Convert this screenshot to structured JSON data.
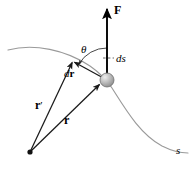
{
  "figure": {
    "background_color": "#ffffff",
    "width": 193,
    "height": 172
  },
  "colors": {
    "path_curve": "#9a9a9a",
    "vector_stroke": "#1a1a1a",
    "force_stroke": "#000000",
    "particle_fill": "#b0b0b0",
    "particle_edge": "#6e6e6e",
    "particle_highlight": "#e8e8e8",
    "dashed_leader": "#555555",
    "angle_arc": "#333333",
    "label_text": "#000000"
  },
  "labels": {
    "force": "F",
    "angle": "θ",
    "arc_length": "ds",
    "arc_length_d": "d",
    "arc_length_s": "s",
    "displacement_d": "d",
    "displacement_r": "r",
    "position_initial": "r",
    "position_initial_prime": "′",
    "position_final": "r",
    "path_parameter": "s"
  },
  "geometry": {
    "particle": {
      "cx": 107,
      "cy": 80,
      "r": 7
    },
    "origin": {
      "x": 30,
      "y": 152
    },
    "force_vector": {
      "x1": 107,
      "y1": 80,
      "x2": 107,
      "y2": 6
    },
    "dr_vector": {
      "x1": 107,
      "y1": 80,
      "x2": 73,
      "y2": 61
    },
    "r_prime_vector": {
      "x1": 30,
      "y1": 152,
      "x2": 73,
      "y2": 61
    },
    "r_vector": {
      "x1": 30,
      "y1": 152,
      "x2": 100,
      "y2": 84
    },
    "angle_arc": {
      "cx": 107,
      "cy": 80,
      "radius": 32,
      "start_deg": 90,
      "end_deg": 151
    },
    "curve": "M 8,50 C 34,43 66,50 90,66 C 100,73 106,79 112,88 C 126,110 140,134 162,146 C 172,151 180,153 188,153"
  },
  "annotations": [
    {
      "name": "force-arrow",
      "text": "F",
      "description": "applied force vector, bold, vertical upward from particle"
    },
    {
      "name": "angle-theta",
      "text": "θ",
      "description": "angle between force F and displacement dr"
    },
    {
      "name": "arc-length-ds",
      "text": "ds",
      "description": "infinitesimal arc length along path, dashed leader to path"
    },
    {
      "name": "displacement-dr",
      "text": "dr",
      "description": "infinitesimal displacement vector"
    },
    {
      "name": "position-r-prime",
      "text": "r′",
      "description": "position vector to earlier point on path"
    },
    {
      "name": "position-r",
      "text": "r",
      "description": "position vector to particle"
    },
    {
      "name": "path-label-s",
      "text": "s",
      "description": "curve path parameter label at bottom right"
    }
  ]
}
